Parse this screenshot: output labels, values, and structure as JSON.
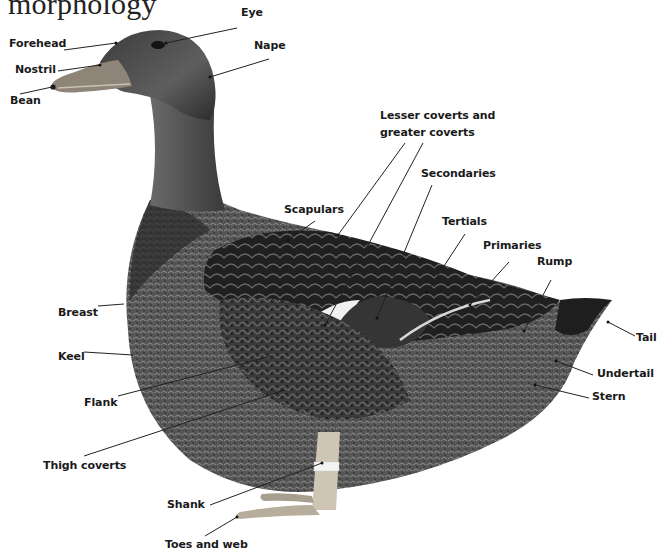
{
  "title": "morphology",
  "colors": {
    "background": "#ffffff",
    "label_text": "#1a1a1a",
    "leader_line": "#222222",
    "plumage_dark": "#1e1e1e",
    "plumage_mid": "#4a4a4a",
    "plumage_light": "#8a8a8a",
    "bill": "#9a8f80",
    "legs": "#c9bfae",
    "leg_band": "#f2f2f2"
  },
  "labels": {
    "eye": "Eye",
    "forehead": "Forehead",
    "nostril": "Nostril",
    "bean": "Bean",
    "nape": "Nape",
    "lesser_greater_coverts_line1": "Lesser coverts and",
    "lesser_greater_coverts_line2": "greater coverts",
    "secondaries": "Secondaries",
    "scapulars": "Scapulars",
    "tertials": "Tertials",
    "primaries": "Primaries",
    "rump": "Rump",
    "tail": "Tail",
    "undertail": "Undertail",
    "stern": "Stern",
    "breast": "Breast",
    "keel": "Keel",
    "flank": "Flank",
    "thigh_coverts": "Thigh coverts",
    "shank": "Shank",
    "toes_and_web": "Toes and web"
  }
}
